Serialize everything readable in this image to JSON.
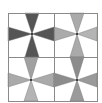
{
  "diagram": {
    "type": "tiled-pinwheel",
    "background": "#ffffff",
    "grid": {
      "x0": 8,
      "y0": 13,
      "x1": 97,
      "y1": 101,
      "mid_x": 54,
      "mid_y": 57,
      "line_color": "#8a8a8a"
    },
    "wedge_half_width": 7,
    "tiles": [
      {
        "name": "top-left",
        "cx": 32,
        "cy": 34,
        "x0": 8,
        "y0": 13,
        "x1": 54,
        "y1": 57,
        "wedges": {
          "top": "#555555",
          "bottom": "#555555",
          "left": "#555555",
          "right": "#555555"
        }
      },
      {
        "name": "top-right",
        "cx": 77,
        "cy": 34,
        "x0": 54,
        "y0": 13,
        "x1": 97,
        "y1": 57,
        "wedges": {
          "top": "#aaaaaa",
          "bottom": "#aaaaaa",
          "left": "#aaaaaa",
          "right": "#b4b4b4"
        }
      },
      {
        "name": "bottom-left",
        "cx": 31,
        "cy": 80,
        "x0": 8,
        "y0": 57,
        "x1": 54,
        "y1": 101,
        "wedges": {
          "top": "#a0a0a0",
          "bottom": "#b4b4b4",
          "left": "#aaaaaa",
          "right": "#aaaaaa"
        }
      },
      {
        "name": "bottom-right",
        "cx": 77,
        "cy": 80,
        "x0": 54,
        "y0": 57,
        "x1": 97,
        "y1": 101,
        "wedges": {
          "top": "#8c8c8c",
          "bottom": "#9a9a9a",
          "left": "#8c8c8c",
          "right": "#9a9a9a"
        }
      }
    ],
    "center_dot_color": "#111111"
  }
}
